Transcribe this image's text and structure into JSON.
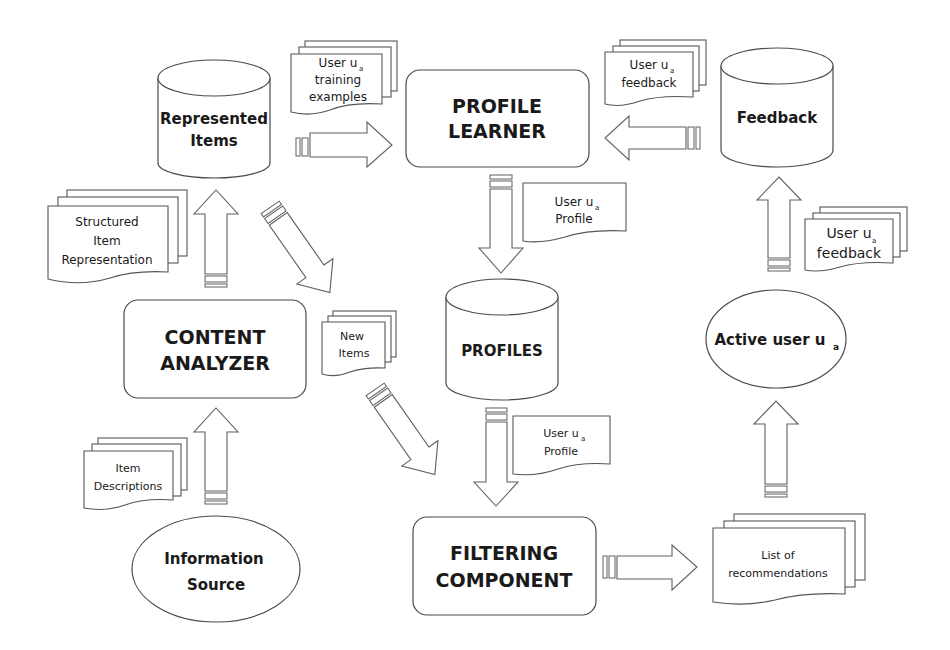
{
  "diagram": {
    "components": {
      "profile_learner": {
        "line1": "PROFILE",
        "line2": "LEARNER"
      },
      "content_analyzer": {
        "line1": "CONTENT",
        "line2": "ANALYZER"
      },
      "filtering_component": {
        "line1": "FILTERING",
        "line2": "COMPONENT"
      }
    },
    "stores": {
      "represented_items": {
        "line1": "Represented",
        "line2": "Items"
      },
      "profiles": {
        "line1": "PROFILES"
      },
      "feedback": {
        "line1": "Feedback"
      }
    },
    "actors": {
      "information_source": {
        "line1": "Information",
        "line2": "Source"
      },
      "active_user": {
        "label": "Active user u",
        "subscript": "a"
      }
    },
    "documents": {
      "training_examples": {
        "line1": "User u",
        "sub": "a",
        "line2": "training",
        "line3": "examples"
      },
      "feedback_top": {
        "line1": "User u",
        "sub": "a",
        "line2": "feedback"
      },
      "profile_top": {
        "line1": "User u",
        "sub": "a",
        "line2": "Profile"
      },
      "structured_item": {
        "line1": "Structured",
        "line2": "Item",
        "line3": "Representation"
      },
      "new_items": {
        "line1": "New",
        "line2": "Items"
      },
      "feedback_right": {
        "line1": "User u",
        "sub": "a",
        "line2": "feedback"
      },
      "profile_bottom": {
        "line1": "User u",
        "sub": "a",
        "line2": "Profile"
      },
      "item_descriptions": {
        "line1": "Item",
        "line2": "Descriptions"
      },
      "recommendations": {
        "line1": "List of",
        "line2": "recommendations"
      }
    },
    "flows": [
      {
        "from": "Represented Items",
        "to": "PROFILE LEARNER",
        "carries": "User u_a training examples"
      },
      {
        "from": "Feedback",
        "to": "PROFILE LEARNER",
        "carries": "User u_a feedback"
      },
      {
        "from": "PROFILE LEARNER",
        "to": "PROFILES",
        "carries": "User u_a Profile"
      },
      {
        "from": "CONTENT ANALYZER",
        "to": "Represented Items",
        "carries": "Structured Item Representation"
      },
      {
        "from": "Represented Items",
        "to": "FILTERING COMPONENT",
        "carries": "New Items"
      },
      {
        "from": "PROFILES",
        "to": "FILTERING COMPONENT",
        "carries": "User u_a Profile"
      },
      {
        "from": "Information Source",
        "to": "CONTENT ANALYZER",
        "carries": "Item Descriptions"
      },
      {
        "from": "FILTERING COMPONENT",
        "to": "Active user u_a",
        "carries": "List of recommendations"
      },
      {
        "from": "Active user u_a",
        "to": "Feedback",
        "carries": "User u_a feedback"
      }
    ]
  }
}
